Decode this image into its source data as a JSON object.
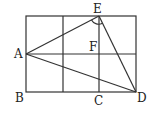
{
  "diagram": {
    "type": "geometry",
    "grid": {
      "cols": 3,
      "rows": 2
    },
    "points": {
      "A": {
        "label": "A"
      },
      "B": {
        "label": "B"
      },
      "C": {
        "label": "C"
      },
      "D": {
        "label": "D"
      },
      "E": {
        "label": "E"
      },
      "F": {
        "label": "F"
      }
    },
    "segments": [
      "AE",
      "AD",
      "ED"
    ],
    "angle_mark": "AED"
  }
}
